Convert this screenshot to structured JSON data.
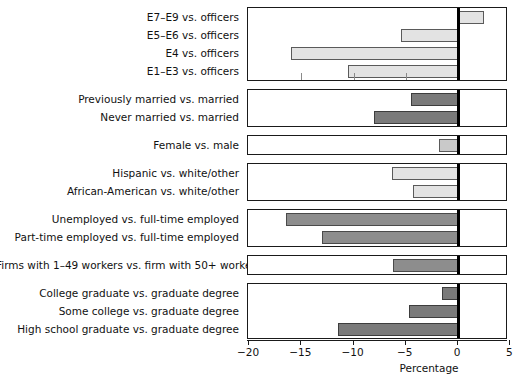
{
  "chart_data": {
    "type": "bar",
    "orientation": "horizontal",
    "title": "",
    "xlabel": "Percentage",
    "ylabel": "",
    "xlim": [
      -21,
      5
    ],
    "xticks": [
      -20,
      -15,
      -10,
      -5,
      0,
      5
    ],
    "xticklabels": [
      "−20",
      "−15",
      "−10",
      "−5",
      "0",
      "5"
    ],
    "grid": false,
    "zero_reference": 0,
    "groups": [
      {
        "name": "pay-grade",
        "shade": "light",
        "categories": [
          "E7–E9 vs. officers",
          "E5–E6 vs. officers",
          "E4 vs. officers",
          "E1–E3 vs. officers"
        ],
        "values": [
          2.5,
          -5.5,
          -16.0,
          -10.5
        ]
      },
      {
        "name": "marital-status",
        "shade": "darker",
        "categories": [
          "Previously married vs. married",
          "Never married vs. married"
        ],
        "values": [
          -4.5,
          -8.0
        ]
      },
      {
        "name": "sex",
        "shade": "mid",
        "categories": [
          "Female vs. male"
        ],
        "values": [
          -1.8
        ]
      },
      {
        "name": "race-ethnicity",
        "shade": "light",
        "categories": [
          "Hispanic vs. white/other",
          "African-American vs. white/other"
        ],
        "values": [
          -6.3,
          -4.3
        ]
      },
      {
        "name": "employment-status",
        "shade": "dark",
        "categories": [
          "Unemployed vs. full-time employed",
          "Part-time employed vs. full-time employed"
        ],
        "values": [
          -16.5,
          -13.0
        ]
      },
      {
        "name": "firm-size",
        "shade": "dark",
        "categories": [
          "Firms with 1–49 workers vs. firm with 50+ workers"
        ],
        "values": [
          -6.2
        ]
      },
      {
        "name": "education",
        "shade": "darker",
        "categories": [
          "College graduate vs. graduate degree",
          "Some college vs. graduate degree",
          "High school graduate vs. graduate degree"
        ],
        "values": [
          -1.5,
          -4.7,
          -11.5
        ]
      }
    ]
  }
}
